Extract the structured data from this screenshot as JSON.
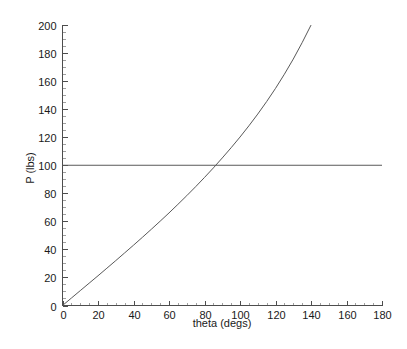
{
  "chart_data": {
    "type": "line",
    "title": "",
    "xlabel": "theta (degs)",
    "ylabel": "P (lbs)",
    "xlim": [
      0,
      180
    ],
    "ylim": [
      0,
      200
    ],
    "grid": false,
    "legend": "none",
    "x_major_ticks": [
      0,
      20,
      40,
      60,
      80,
      100,
      120,
      140,
      160,
      180
    ],
    "y_major_ticks": [
      0,
      20,
      40,
      60,
      80,
      100,
      120,
      140,
      160,
      180,
      200
    ],
    "x_minor_tick_step": 5,
    "y_minor_tick_step": 5,
    "x_tick_labels": [
      "0",
      "20",
      "40",
      "60",
      "80",
      "100",
      "120",
      "140",
      "160",
      "180"
    ],
    "y_tick_labels": [
      "0",
      "20",
      "40",
      "60",
      "80",
      "100",
      "120",
      "140",
      "160",
      "180",
      "200"
    ],
    "series": [
      {
        "name": "reference",
        "style": "horizontal-line",
        "color": "#595959",
        "constant_y": 100,
        "x": [
          0,
          180
        ],
        "values": [
          100,
          100
        ]
      },
      {
        "name": "P curve",
        "style": "curve",
        "color": "#595959",
        "x": [
          0,
          5,
          10,
          15,
          20,
          25,
          30,
          35,
          40,
          45,
          50,
          55,
          60,
          65,
          70,
          75,
          80,
          85,
          90,
          95,
          100,
          105,
          110,
          115,
          120,
          125,
          130,
          135,
          140,
          143,
          146,
          148,
          150,
          151,
          152,
          153
        ],
        "values": [
          0,
          5.3,
          10.6,
          15.9,
          21.2,
          26.6,
          32.0,
          37.5,
          43.0,
          48.6,
          54.3,
          60.1,
          66.0,
          72.1,
          78.3,
          84.7,
          91.3,
          98.1,
          105.2,
          112.5,
          120.1,
          128.1,
          136.5,
          145.4,
          154.8,
          164.9,
          175.7,
          187.4,
          199.9,
          207.8,
          216.2,
          222.0,
          228.0,
          231.1,
          234.3,
          237.6
        ]
      }
    ],
    "annotations": {
      "intersection_theta": 94,
      "intersection_P": 100
    }
  },
  "axis_colors": {
    "line": "#4d4d4d",
    "data": "#595959",
    "text": "#1a1a1a",
    "background": "#ffffff"
  }
}
